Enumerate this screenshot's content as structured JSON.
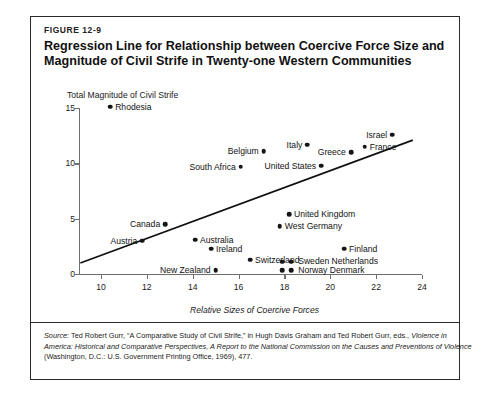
{
  "figure": {
    "number": "FIGURE 12-9",
    "title_line1": "Regression Line for Relationship between Coercive Force Size and",
    "title_line2": "Magnitude of Civil Strife in Twenty-one Western Communities"
  },
  "source": {
    "label": "Source:",
    "line1_a": " Ted Robert Gurr, “A Comparative Study of Civil Strife,” in Hugh Davis Graham and Ted Robert Gurr, eds., ",
    "line1_b": "Violence in",
    "line2": "America: Historical and Comparative Perspectives, A Report to the National Commission on the Causes and Preventions of Violence",
    "line3": "(Washington, D.C.: U.S. Government Printing Office, 1969), 477."
  },
  "chart_data": {
    "type": "scatter",
    "title": "Regression Line for Relationship between Coercive Force Size and Magnitude of Civil Strife in Twenty-one Western Communities",
    "xlabel": "Relative Sizes of Coercive Forces",
    "ylabel": "Total Magnitude of Civil Strife",
    "xlim": [
      9,
      24.6
    ],
    "ylim": [
      0,
      15.6
    ],
    "xticks": [
      10,
      12,
      14,
      16,
      18,
      20,
      22,
      24
    ],
    "yticks": [
      0,
      5,
      10,
      15
    ],
    "grid": false,
    "legend": false,
    "regression_line": {
      "x1": 9.1,
      "y1": 1.0,
      "x2": 23.6,
      "y2": 12.1
    },
    "points": [
      {
        "label": "Rhodesia",
        "x": 10.4,
        "y": 15.1,
        "label_pos": "right"
      },
      {
        "label": "Israel",
        "x": 22.7,
        "y": 12.6,
        "label_pos": "left"
      },
      {
        "label": "Italy",
        "x": 19.0,
        "y": 11.7,
        "label_pos": "left"
      },
      {
        "label": "France",
        "x": 21.5,
        "y": 11.5,
        "label_pos": "right"
      },
      {
        "label": "Belgium",
        "x": 17.1,
        "y": 11.1,
        "label_pos": "left"
      },
      {
        "label": "Greece",
        "x": 20.9,
        "y": 11.0,
        "label_pos": "left"
      },
      {
        "label": "South Africa",
        "x": 16.1,
        "y": 9.7,
        "label_pos": "left"
      },
      {
        "label": "United States",
        "x": 19.6,
        "y": 9.8,
        "label_pos": "left"
      },
      {
        "label": "United Kingdom",
        "x": 18.2,
        "y": 5.4,
        "label_pos": "right"
      },
      {
        "label": "Canada",
        "x": 12.8,
        "y": 4.5,
        "label_pos": "left"
      },
      {
        "label": "West Germany",
        "x": 17.8,
        "y": 4.3,
        "label_pos": "right"
      },
      {
        "label": "Austria",
        "x": 11.8,
        "y": 3.0,
        "label_pos": "left"
      },
      {
        "label": "Australia",
        "x": 14.1,
        "y": 3.1,
        "label_pos": "right"
      },
      {
        "label": "Ireland",
        "x": 14.8,
        "y": 2.3,
        "label_pos": "right"
      },
      {
        "label": "Finland",
        "x": 20.6,
        "y": 2.3,
        "label_pos": "right"
      },
      {
        "label": "Switzerland",
        "x": 16.5,
        "y": 1.3,
        "label_pos": "right"
      },
      {
        "label": "New Zealand",
        "x": 15.0,
        "y": 0.35,
        "label_pos": "left"
      },
      {
        "label": "Sweden",
        "x": 17.9,
        "y": 1.1,
        "label_pos": "none"
      },
      {
        "label": "Netherlands",
        "x": 18.3,
        "y": 1.1,
        "label_pos": "none"
      },
      {
        "label": "Norway",
        "x": 17.9,
        "y": 0.35,
        "label_pos": "none"
      },
      {
        "label": "Denmark",
        "x": 18.3,
        "y": 0.35,
        "label_pos": "none"
      }
    ],
    "cluster_labels": [
      {
        "text": "Sweden Netherlands",
        "x": 18.6,
        "y": 1.15
      },
      {
        "text": "Norway Denmark",
        "x": 18.6,
        "y": 0.4
      }
    ]
  }
}
